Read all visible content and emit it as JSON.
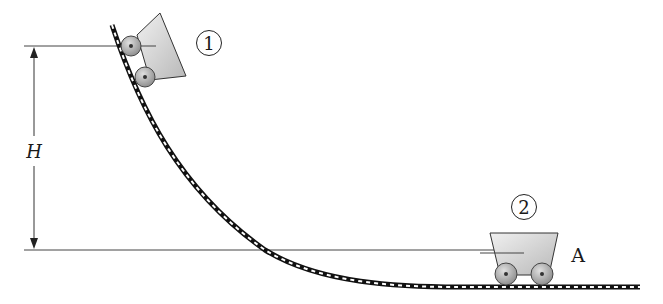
{
  "figure": {
    "labels": {
      "height": "H",
      "state_1": "1",
      "state_2": "2",
      "point_a": "A"
    },
    "colors": {
      "line": "#3a3a3a",
      "cart_fill_light": "#e8e8e8",
      "cart_fill_dark": "#bdbdbd",
      "wheel_fill": "#a9a9a9",
      "track_dark": "#111111",
      "track_light": "#ffffff"
    }
  }
}
